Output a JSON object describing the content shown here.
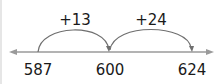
{
  "number_line": {
    "range_start_arrow": true,
    "range_end_arrow": true,
    "line_color": "#9a9a9a",
    "arc_color": "#6f6f6f",
    "ticks": [
      {
        "label": "587",
        "x": 38
      },
      {
        "label": "600",
        "x": 110
      },
      {
        "label": "624",
        "x": 192
      }
    ],
    "jumps": [
      {
        "label": "+13",
        "from": "587",
        "to": "600",
        "label_x": 75
      },
      {
        "label": "+24",
        "from": "600",
        "to": "624",
        "label_x": 151
      }
    ]
  }
}
